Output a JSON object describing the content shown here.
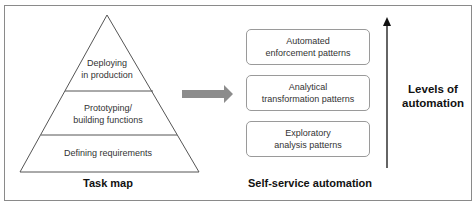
{
  "pyramid": {
    "levels": [
      {
        "line1": "Deploying",
        "line2": "in production"
      },
      {
        "line1": "Prototyping/",
        "line2": "building functions"
      },
      {
        "line1": "Defining requirements",
        "line2": ""
      }
    ],
    "caption": "Task map"
  },
  "arrow": {
    "color": "#8c8c8c"
  },
  "patterns": {
    "boxes": [
      {
        "line1": "Automated",
        "line2": "enforcement patterns"
      },
      {
        "line1": "Analytical",
        "line2": "transformation patterns"
      },
      {
        "line1": "Exploratory",
        "line2": "analysis patterns"
      }
    ],
    "caption": "Self-service automation"
  },
  "levels_axis": {
    "line1": "Levels of",
    "line2": "automation"
  }
}
